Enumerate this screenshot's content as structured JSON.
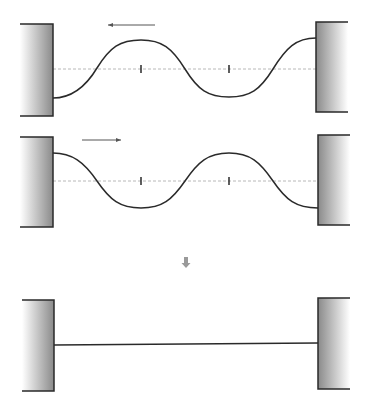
{
  "diagram": {
    "colors": {
      "line": "#2a2a2a",
      "dashed": "#b8b8b8",
      "wall_dark": "#8a8a8a",
      "wall_light": "#ffffff",
      "down_arrow": "#9a9a9a"
    },
    "panels": [
      {
        "id": "wave-leftward",
        "direction": "left",
        "arrow": {
          "x1": 155,
          "x2": 108,
          "y": 25
        },
        "center_y": 69,
        "wave_path": "M53 98 C 70 98, 85 88, 97 68 C 110 47, 120 40, 141 40 C 162 40, 172 48, 185 69 C 198 90, 208 97, 229 97 C 250 97, 260 90, 273 69 C 286 48, 296 38, 316 38",
        "ticks_x": [
          141,
          229
        ],
        "left_wall": {
          "x": 20,
          "y": 24,
          "w": 33,
          "h": 92
        },
        "right_wall": {
          "x": 316,
          "y": 22,
          "w": 32,
          "h": 90
        }
      },
      {
        "id": "wave-rightward",
        "direction": "right",
        "arrow": {
          "x1": 82,
          "x2": 121,
          "y": 140
        },
        "center_y": 181,
        "wave_path": "M53 153 C 72 153, 84 162, 97 181 C 110 200, 120 208, 141 208 C 162 208, 172 200, 185 181 C 198 162, 208 153, 229 153 C 250 153, 260 162, 273 181 C 286 200, 296 208, 318 208",
        "ticks_x": [
          141,
          229
        ],
        "left_wall": {
          "x": 20,
          "y": 137,
          "w": 33,
          "h": 90
        },
        "right_wall": {
          "x": 318,
          "y": 135,
          "w": 32,
          "h": 90
        }
      },
      {
        "id": "superposition-flat",
        "direction": "none",
        "line": {
          "x1": 54,
          "y1": 345,
          "x2": 318,
          "y2": 343
        },
        "left_wall": {
          "x": 22,
          "y": 300,
          "w": 32,
          "h": 91
        },
        "right_wall": {
          "x": 318,
          "y": 298,
          "w": 32,
          "h": 91
        }
      }
    ],
    "result_arrow": {
      "x": 186,
      "y": 262,
      "symbol": "down-arrow"
    }
  }
}
